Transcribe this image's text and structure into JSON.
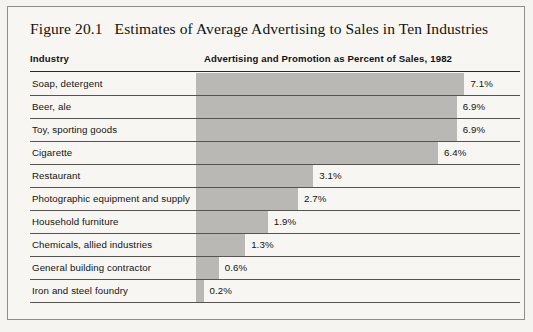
{
  "figure": {
    "number_label": "Figure 20.1",
    "title": "Estimates of Average Advertising to Sales in Ten Industries",
    "columns": {
      "industry": "Industry",
      "metric": "Advertising and Promotion as Percent of Sales, 1982"
    },
    "colors": {
      "bar_fill": "#b9b8b4",
      "page_background": "#f7f6f3",
      "frame_border": "#8d8d8b",
      "rule": "#2a2a28",
      "text": "#14130f"
    }
  },
  "chart_data": {
    "type": "bar",
    "orientation": "horizontal",
    "title": "Estimates of Average Advertising to Sales in Ten Industries",
    "xlabel": "Advertising and Promotion as Percent of Sales, 1982",
    "ylabel": "Industry",
    "xlim": [
      0,
      8
    ],
    "grid": false,
    "legend": false,
    "unit": "%",
    "categories": [
      "Soap, detergent",
      "Beer, ale",
      "Toy, sporting goods",
      "Cigarette",
      "Restaurant",
      "Photographic equipment and supply",
      "Household furniture",
      "Chemicals, allied industries",
      "General building contractor",
      "Iron and steel foundry"
    ],
    "values": [
      7.1,
      6.9,
      6.9,
      6.4,
      3.1,
      2.7,
      1.9,
      1.3,
      0.6,
      0.2
    ],
    "value_labels": [
      "7.1%",
      "6.9%",
      "6.9%",
      "6.4%",
      "3.1%",
      "2.7%",
      "1.9%",
      "1.3%",
      "0.6%",
      "0.2%"
    ]
  }
}
